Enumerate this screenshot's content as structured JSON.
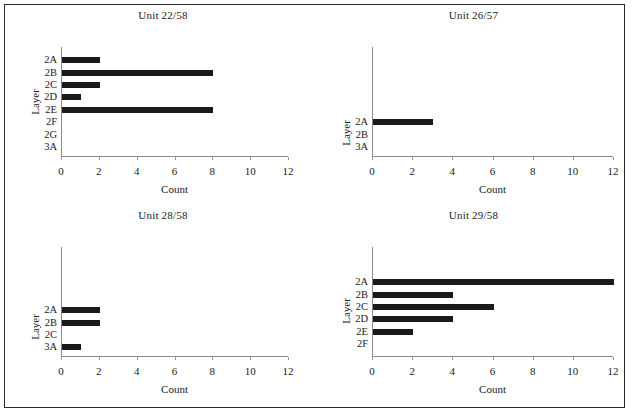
{
  "figure": {
    "border_color": "#2b2b2b",
    "bar_color": "#1a1a1a",
    "axis_color": "#8a8a8a",
    "background": "#ffffff"
  },
  "chart_data": [
    {
      "type": "bar",
      "orientation": "horizontal",
      "title": "Unit 22/58",
      "xlabel": "Count",
      "ylabel": "Layer",
      "categories": [
        "2A",
        "2B",
        "2C",
        "2D",
        "2E",
        "2F",
        "2G",
        "3A"
      ],
      "values": [
        2,
        8,
        2,
        1,
        8,
        0,
        0,
        0
      ],
      "xlim": [
        0,
        12
      ],
      "xticks": [
        0,
        2,
        4,
        6,
        8,
        10,
        12
      ],
      "xticklabels": [
        "0",
        "2",
        "4",
        "6",
        "8",
        "10",
        "12"
      ],
      "grid": false,
      "legend": "none"
    },
    {
      "type": "bar",
      "orientation": "horizontal",
      "title": "Unit 26/57",
      "xlabel": "Count",
      "ylabel": "Layer",
      "categories": [
        "2A",
        "2B",
        "3A"
      ],
      "values": [
        3,
        0,
        0
      ],
      "xlim": [
        0,
        12
      ],
      "xticks": [
        0,
        2,
        4,
        6,
        8,
        10,
        12
      ],
      "xticklabels": [
        "0",
        "2",
        "4",
        "6",
        "8",
        "10",
        "12"
      ],
      "grid": false,
      "legend": "none"
    },
    {
      "type": "bar",
      "orientation": "horizontal",
      "title": "Unit 28/58",
      "xlabel": "Count",
      "ylabel": "Layer",
      "categories": [
        "2A",
        "2B",
        "2C",
        "3A"
      ],
      "values": [
        2,
        2,
        0,
        1
      ],
      "xlim": [
        0,
        12
      ],
      "xticks": [
        0,
        2,
        4,
        6,
        8,
        10,
        12
      ],
      "xticklabels": [
        "0",
        "2",
        "4",
        "6",
        "8",
        "10",
        "12"
      ],
      "grid": false,
      "legend": "none"
    },
    {
      "type": "bar",
      "orientation": "horizontal",
      "title": "Unit 29/58",
      "xlabel": "Count",
      "ylabel": "Layer",
      "categories": [
        "2A",
        "2B",
        "2C",
        "2D",
        "2E",
        "2F"
      ],
      "values": [
        12,
        4,
        6,
        4,
        2,
        0
      ],
      "xlim": [
        0,
        12
      ],
      "xticks": [
        0,
        2,
        4,
        6,
        8,
        10,
        12
      ],
      "xticklabels": [
        "0",
        "2",
        "4",
        "6",
        "8",
        "10",
        "12"
      ],
      "grid": false,
      "legend": "none"
    }
  ],
  "panels": [
    {
      "id": "unit-22-58",
      "title": "Unit 22/58",
      "xlabel": "Count",
      "ylabel": "Layer",
      "layout": {
        "left": 0,
        "top": 4,
        "width": 316,
        "height": 200
      },
      "plot": {
        "left": 56,
        "top": 38,
        "width": 227,
        "height": 110
      },
      "bar_height": 6,
      "row_step": 12.4,
      "row_offset": 7
    },
    {
      "id": "unit-26-57",
      "title": "Unit 26/57",
      "xlabel": "Count",
      "ylabel": "Layer",
      "layout": {
        "left": 316,
        "top": 4,
        "width": 305,
        "height": 200
      },
      "plot": {
        "left": 51,
        "top": 38,
        "width": 241,
        "height": 110
      },
      "bar_height": 6,
      "row_step": 12.4,
      "row_offset": 69
    },
    {
      "id": "unit-28-58",
      "title": "Unit 28/58",
      "xlabel": "Count",
      "ylabel": "Layer",
      "layout": {
        "left": 0,
        "top": 204,
        "width": 316,
        "height": 200
      },
      "plot": {
        "left": 56,
        "top": 38,
        "width": 227,
        "height": 110
      },
      "bar_height": 6,
      "row_step": 12.4,
      "row_offset": 57
    },
    {
      "id": "unit-29-58",
      "title": "Unit 29/58",
      "xlabel": "Count",
      "ylabel": "Layer",
      "layout": {
        "left": 316,
        "top": 204,
        "width": 305,
        "height": 200
      },
      "plot": {
        "left": 51,
        "top": 38,
        "width": 241,
        "height": 110
      },
      "bar_height": 6,
      "row_step": 12.4,
      "row_offset": 29
    }
  ]
}
